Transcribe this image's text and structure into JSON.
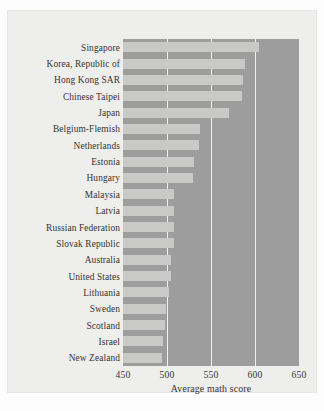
{
  "chart_data": {
    "type": "bar",
    "orientation": "horizontal",
    "title": "",
    "xlabel": "Average math score",
    "ylabel": "",
    "xlim": [
      450,
      650
    ],
    "ylim": null,
    "xticks": [
      450,
      500,
      550,
      600,
      650
    ],
    "xtick_labels": [
      "450",
      "500",
      "550",
      "600",
      "650"
    ],
    "grid": "vertical gridlines at 500, 550, 600",
    "gridlines": [
      500,
      550,
      600
    ],
    "legend": null,
    "legend_position": "none",
    "bar_color": "#c9c9c7",
    "plot_background": "#9d9d9d",
    "figure_background": "#eeeeec",
    "categories": [
      "Singapore",
      "Korea, Republic of",
      "Hong Kong SAR",
      "Chinese Taipei",
      "Japan",
      "Belgium-Flemish",
      "Netherlands",
      "Estonia",
      "Hungary",
      "Malaysia",
      "Latvia",
      "Russian Federation",
      "Slovak Republic",
      "Australia",
      "United States",
      "Lithuania",
      "Sweden",
      "Scotland",
      "Israel",
      "New Zealand"
    ],
    "values": [
      604,
      589,
      586,
      585,
      570,
      537,
      536,
      531,
      529,
      508,
      508,
      508,
      508,
      505,
      504,
      502,
      499,
      498,
      496,
      494
    ]
  },
  "axis": {
    "x_title": "Average math score"
  }
}
